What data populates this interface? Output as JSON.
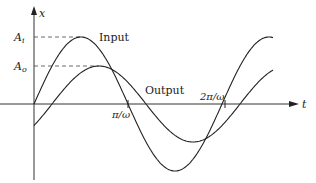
{
  "diagram": {
    "axes": {
      "vertical_label": "x",
      "horizontal_label": "t"
    },
    "levels": [
      {
        "label": "A_i",
        "main": "A",
        "sub": "i"
      },
      {
        "label": "A_o",
        "main": "A",
        "sub": "o"
      }
    ],
    "curves": [
      {
        "name": "Input",
        "label": "Input",
        "amplitude_label": "A_i",
        "color": "#222222"
      },
      {
        "name": "Output",
        "label": "Output",
        "amplitude_label": "A_o",
        "color": "#222222"
      }
    ],
    "ticks": [
      {
        "label": "π/ω"
      },
      {
        "label": "2π/ω"
      }
    ]
  }
}
